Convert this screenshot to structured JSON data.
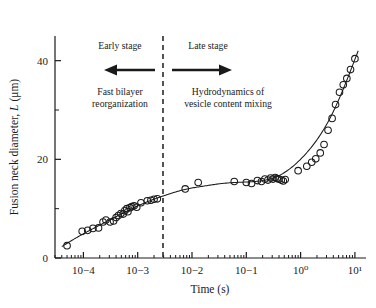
{
  "figure": {
    "title": "",
    "background": "#ffffff",
    "ink_color": "#1a1a1a"
  },
  "axes": {
    "x_title": "Time (s)",
    "y_title_parts": {
      "main": "Fusion neck diameter, ",
      "italic_symbol": "L",
      "units": " (μm)"
    },
    "y_title_full": "Fusion neck diameter, L (μm)",
    "x_tick_labels": [
      "10−4",
      "10−3",
      "10−2",
      "10−1",
      "10⁰",
      "10¹"
    ],
    "y_tick_labels": [
      "0",
      "20",
      "40"
    ]
  },
  "annotations": {
    "early_stage_title": "Early stage",
    "late_stage_title": "Late stage",
    "early_stage_line1": "Fast bilayer",
    "early_stage_line2": "reorganization",
    "late_stage_line1": "Hydrodynamics of",
    "late_stage_line2": "vesicle content mixing",
    "left_arrow": "left-arrow",
    "right_arrow": "right-arrow",
    "divider": "dashed-vertical-divider"
  },
  "chart_data": {
    "type": "scatter",
    "title": "",
    "xlabel": "Time (s)",
    "ylabel": "Fusion neck diameter, L (μm)",
    "xscale": "log",
    "yscale": "linear",
    "xlim": [
      3e-05,
      16.0
    ],
    "ylim": [
      0,
      45
    ],
    "yticks": [
      0,
      20,
      40
    ],
    "xticks": [
      0.0001,
      0.001,
      0.01,
      0.1,
      1.0,
      10.0
    ],
    "grid": false,
    "legend": null,
    "marker": "open-circle",
    "divider_x": 0.004,
    "series": [
      {
        "name": "Fusion neck diameter vs time",
        "x": [
          5e-05,
          9.5e-05,
          0.00012,
          0.00015,
          0.00019,
          0.00023,
          0.00026,
          0.00031,
          0.00036,
          0.0004,
          0.00044,
          0.00049,
          0.00054,
          0.00058,
          0.00063,
          0.00066,
          0.00072,
          0.00078,
          0.00086,
          0.00096,
          0.00115,
          0.0015,
          0.00175,
          0.002,
          0.0023,
          0.0075,
          0.013,
          0.06,
          0.1,
          0.125,
          0.16,
          0.19,
          0.22,
          0.25,
          0.28,
          0.31,
          0.34,
          0.37,
          0.4,
          0.44,
          0.48,
          0.52,
          0.9,
          1.3,
          1.6,
          1.9,
          2.3,
          2.7,
          3.2,
          3.8,
          4.4,
          5.2,
          6.1,
          7.1,
          8.3,
          10.0
        ],
        "y": [
          2.5,
          5.4,
          5.6,
          6.0,
          6.1,
          7.3,
          7.7,
          7.3,
          7.5,
          8.2,
          8.6,
          9.0,
          8.9,
          9.6,
          10.0,
          9.4,
          10.2,
          10.4,
          10.6,
          10.3,
          11.2,
          11.6,
          11.7,
          11.9,
          12.0,
          14.0,
          15.3,
          15.5,
          15.3,
          15.1,
          15.7,
          15.5,
          16.0,
          15.8,
          16.2,
          16.0,
          16.3,
          16.1,
          16.0,
          15.8,
          15.6,
          15.9,
          17.7,
          18.6,
          19.4,
          20.1,
          21.3,
          23.0,
          25.9,
          28.3,
          31.1,
          33.6,
          35.1,
          36.4,
          38.2,
          40.4
        ]
      }
    ],
    "fit_curve": {
      "name": "model-fit-line",
      "description": "Smooth monotonic curve through points: rapid early growth, plateau near L = 15-16 between 10^-2 and 10^0 s, then steep late-stage rise."
    }
  }
}
